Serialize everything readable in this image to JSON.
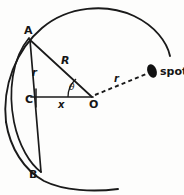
{
  "figure": {
    "stroke_color": "#1a1a1a",
    "background_color": "#fdfdfc",
    "spot_color": "#111111",
    "points": {
      "A": {
        "label": "A",
        "x": 29,
        "y": 38
      },
      "B": {
        "label": "B",
        "x": 41,
        "y": 172
      },
      "C": {
        "label": "C",
        "x": 37,
        "y": 98
      },
      "O": {
        "label": "O",
        "x": 92,
        "y": 97
      }
    },
    "labels": {
      "point_a": "A",
      "point_b": "B",
      "point_c": "C",
      "point_o": "O",
      "radius_big": "R",
      "radius_small": "r",
      "distance_spot": "r",
      "segment_x": "x",
      "angle_theta": "θ",
      "spot": "spot"
    },
    "label_positions": {
      "point_a": {
        "x": 24,
        "y": 25
      },
      "point_b": {
        "x": 29,
        "y": 169
      },
      "point_c": {
        "x": 25,
        "y": 94
      },
      "point_o": {
        "x": 89,
        "y": 99
      },
      "radius_big": {
        "x": 61,
        "y": 55
      },
      "radius_small": {
        "x": 32,
        "y": 68
      },
      "distance_spot": {
        "x": 114,
        "y": 74
      },
      "segment_x": {
        "x": 58,
        "y": 100
      },
      "angle_theta": {
        "x": 69,
        "y": 83
      },
      "spot": {
        "x": 160,
        "y": 66
      }
    },
    "geometry": {
      "outer_arc_note": "large circular arc centred near O passing from lower area around top-right",
      "inner_arc_note": "smaller circular arc centred near C through A and B",
      "chord_note": "vertical chord A-B crossing through C",
      "spot_ellipse": {
        "cx": 152,
        "cy": 71,
        "rx": 5,
        "ry": 7,
        "rotation_deg": -20
      },
      "dashed_line": {
        "x1": 95,
        "y1": 95,
        "x2": 146,
        "y2": 74
      }
    }
  }
}
